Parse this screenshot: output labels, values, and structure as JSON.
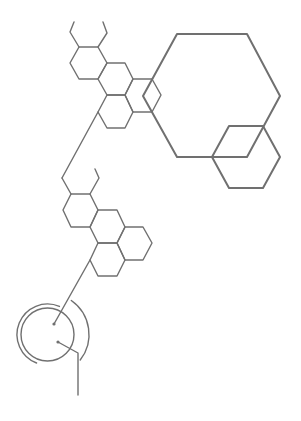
{
  "canvas": {
    "width": 301,
    "height": 421,
    "background": "#ffffff"
  },
  "style": {
    "stroke": "#707070",
    "stroke_thin": 1.4,
    "stroke_thick": 2.0,
    "dot_radius": 1.6
  },
  "diagram": {
    "title": "Molecular hexagon structure diagram",
    "upper_cluster": {
      "name": "upper-fused-rings",
      "polylines": [
        {
          "name": "stub-top-left",
          "points": [
            [
              74,
              22
            ],
            [
              70,
              32
            ],
            [
              79,
              47
            ]
          ]
        },
        {
          "name": "stub-top-right",
          "points": [
            [
              103,
              22
            ],
            [
              107,
              33
            ],
            [
              98,
              47
            ]
          ]
        }
      ],
      "hexagons": [
        {
          "name": "hex-a",
          "points": [
            [
              79,
              47
            ],
            [
              98,
              47
            ],
            [
              107,
              63
            ],
            [
              98,
              79
            ],
            [
              79,
              79
            ],
            [
              70,
              63
            ]
          ]
        },
        {
          "name": "hex-b",
          "points": [
            [
              107,
              63
            ],
            [
              125,
              63
            ],
            [
              133,
              79
            ],
            [
              125,
              95
            ],
            [
              107,
              95
            ],
            [
              98,
              79
            ]
          ]
        },
        {
          "name": "hex-c",
          "points": [
            [
              133,
              79
            ],
            [
              152,
              79
            ],
            [
              161,
              95
            ],
            [
              152,
              112
            ],
            [
              133,
              112
            ],
            [
              125,
              95
            ]
          ]
        },
        {
          "name": "hex-d",
          "points": [
            [
              107,
              95
            ],
            [
              125,
              95
            ],
            [
              133,
              112
            ],
            [
              125,
              128
            ],
            [
              107,
              128
            ],
            [
              98,
              112
            ]
          ]
        }
      ]
    },
    "large_rings": {
      "name": "large-hexagons",
      "hexagons": [
        {
          "name": "hex-large",
          "points": [
            [
              177,
              34
            ],
            [
              247,
              34
            ],
            [
              280,
              96
            ],
            [
              247,
              157
            ],
            [
              177,
              157
            ],
            [
              143,
              96
            ]
          ]
        },
        {
          "name": "hex-medium",
          "points": [
            [
              229,
              126
            ],
            [
              263,
              126
            ],
            [
              280,
              157
            ],
            [
              263,
              188
            ],
            [
              229,
              188
            ],
            [
              212,
              157
            ]
          ]
        }
      ]
    },
    "connector_1": {
      "name": "bond-upper-to-lower",
      "points": [
        [
          98,
          112
        ],
        [
          62,
          178
        ]
      ]
    },
    "lower_cluster": {
      "name": "lower-fused-rings",
      "polylines": [
        {
          "name": "stub-left",
          "points": [
            [
              62,
              178
            ],
            [
              71,
              194
            ]
          ]
        },
        {
          "name": "stub-right",
          "points": [
            [
              95,
              169
            ],
            [
              99,
              178
            ],
            [
              90,
              194
            ]
          ]
        }
      ],
      "hexagons": [
        {
          "name": "hex-e",
          "points": [
            [
              71,
              194
            ],
            [
              90,
              194
            ],
            [
              98,
              210
            ],
            [
              90,
              227
            ],
            [
              71,
              227
            ],
            [
              63,
              210
            ]
          ]
        },
        {
          "name": "hex-f",
          "points": [
            [
              98,
              210
            ],
            [
              117,
              210
            ],
            [
              125,
              227
            ],
            [
              117,
              243
            ],
            [
              98,
              243
            ],
            [
              90,
              227
            ]
          ]
        },
        {
          "name": "hex-g",
          "points": [
            [
              125,
              227
            ],
            [
              143,
              227
            ],
            [
              152,
              243
            ],
            [
              143,
              260
            ],
            [
              125,
              260
            ],
            [
              117,
              243
            ]
          ]
        },
        {
          "name": "hex-h",
          "points": [
            [
              98,
              243
            ],
            [
              117,
              243
            ],
            [
              125,
              260
            ],
            [
              117,
              276
            ],
            [
              98,
              276
            ],
            [
              90,
              260
            ]
          ]
        }
      ]
    },
    "connector_2": {
      "name": "bond-lower-to-circle",
      "points": [
        [
          90,
          260
        ],
        [
          54,
          324
        ]
      ]
    },
    "circle_group": {
      "name": "circle-symbol",
      "center": [
        47.5,
        334.5
      ],
      "inner_circle_r": 26.5,
      "left_arc": {
        "r": 30.5,
        "start_deg": 111,
        "end_deg": 293
      },
      "right_arc": {
        "r": 41.5,
        "start_deg": -55,
        "end_deg": 38
      },
      "dots": [
        [
          54,
          324
        ],
        [
          58,
          342
        ]
      ],
      "tail": {
        "points": [
          [
            58,
            342
          ],
          [
            78,
            353
          ],
          [
            78,
            395
          ]
        ]
      }
    }
  }
}
